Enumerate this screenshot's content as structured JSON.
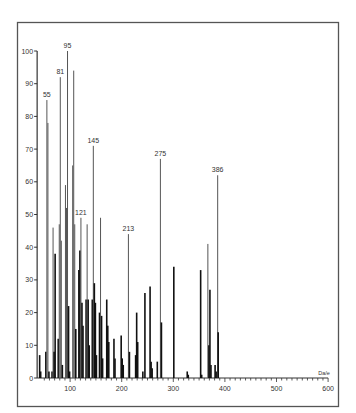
{
  "chart_data": {
    "type": "bar",
    "subtype": "mass-spectrum",
    "title": "",
    "xlabel": "Da/e",
    "ylabel": "",
    "xlim": [
      40,
      600
    ],
    "ylim": [
      0,
      100
    ],
    "grid": false,
    "legend": null,
    "x_ticks": [
      100,
      200,
      300,
      400,
      500,
      600
    ],
    "y_ticks": [
      0,
      10,
      20,
      30,
      40,
      50,
      60,
      70,
      80,
      90,
      100
    ],
    "peak_labels": [
      {
        "mz": 55,
        "value": 85,
        "label": "55"
      },
      {
        "mz": 81,
        "value": 92,
        "label": "81"
      },
      {
        "mz": 95,
        "value": 100,
        "label": "95"
      },
      {
        "mz": 121,
        "value": 49,
        "label": "121"
      },
      {
        "mz": 145,
        "value": 71,
        "label": "145"
      },
      {
        "mz": 213,
        "value": 44,
        "label": "213"
      },
      {
        "mz": 275,
        "value": 67,
        "label": "275"
      },
      {
        "mz": 386,
        "value": 62,
        "label": "386"
      }
    ],
    "peaks": [
      {
        "mz": 41,
        "value": 7
      },
      {
        "mz": 43,
        "value": 2
      },
      {
        "mz": 53,
        "value": 8
      },
      {
        "mz": 55,
        "value": 85
      },
      {
        "mz": 57,
        "value": 78
      },
      {
        "mz": 59,
        "value": 2
      },
      {
        "mz": 65,
        "value": 2
      },
      {
        "mz": 67,
        "value": 46
      },
      {
        "mz": 69,
        "value": 8
      },
      {
        "mz": 71,
        "value": 38
      },
      {
        "mz": 77,
        "value": 12
      },
      {
        "mz": 79,
        "value": 47
      },
      {
        "mz": 81,
        "value": 92
      },
      {
        "mz": 83,
        "value": 42
      },
      {
        "mz": 85,
        "value": 4
      },
      {
        "mz": 91,
        "value": 59
      },
      {
        "mz": 93,
        "value": 52
      },
      {
        "mz": 95,
        "value": 100
      },
      {
        "mz": 97,
        "value": 22
      },
      {
        "mz": 99,
        "value": 2
      },
      {
        "mz": 105,
        "value": 65
      },
      {
        "mz": 107,
        "value": 94
      },
      {
        "mz": 109,
        "value": 47
      },
      {
        "mz": 111,
        "value": 15
      },
      {
        "mz": 117,
        "value": 33
      },
      {
        "mz": 119,
        "value": 39
      },
      {
        "mz": 121,
        "value": 49
      },
      {
        "mz": 123,
        "value": 23
      },
      {
        "mz": 125,
        "value": 16
      },
      {
        "mz": 131,
        "value": 24
      },
      {
        "mz": 133,
        "value": 47
      },
      {
        "mz": 135,
        "value": 24
      },
      {
        "mz": 137,
        "value": 10
      },
      {
        "mz": 143,
        "value": 24
      },
      {
        "mz": 145,
        "value": 71
      },
      {
        "mz": 147,
        "value": 29
      },
      {
        "mz": 149,
        "value": 23
      },
      {
        "mz": 151,
        "value": 7
      },
      {
        "mz": 157,
        "value": 20
      },
      {
        "mz": 159,
        "value": 49
      },
      {
        "mz": 161,
        "value": 19
      },
      {
        "mz": 163,
        "value": 6
      },
      {
        "mz": 171,
        "value": 24
      },
      {
        "mz": 173,
        "value": 16
      },
      {
        "mz": 175,
        "value": 11
      },
      {
        "mz": 185,
        "value": 12
      },
      {
        "mz": 187,
        "value": 6
      },
      {
        "mz": 199,
        "value": 13
      },
      {
        "mz": 201,
        "value": 6
      },
      {
        "mz": 203,
        "value": 4
      },
      {
        "mz": 213,
        "value": 44
      },
      {
        "mz": 215,
        "value": 8
      },
      {
        "mz": 227,
        "value": 7
      },
      {
        "mz": 229,
        "value": 20
      },
      {
        "mz": 231,
        "value": 11
      },
      {
        "mz": 241,
        "value": 2
      },
      {
        "mz": 245,
        "value": 26
      },
      {
        "mz": 255,
        "value": 28
      },
      {
        "mz": 257,
        "value": 5
      },
      {
        "mz": 259,
        "value": 3
      },
      {
        "mz": 269,
        "value": 5
      },
      {
        "mz": 275,
        "value": 67
      },
      {
        "mz": 277,
        "value": 17
      },
      {
        "mz": 301,
        "value": 34
      },
      {
        "mz": 327,
        "value": 2
      },
      {
        "mz": 329,
        "value": 1
      },
      {
        "mz": 353,
        "value": 33
      },
      {
        "mz": 355,
        "value": 1
      },
      {
        "mz": 367,
        "value": 41
      },
      {
        "mz": 369,
        "value": 10
      },
      {
        "mz": 371,
        "value": 27
      },
      {
        "mz": 373,
        "value": 4
      },
      {
        "mz": 381,
        "value": 4
      },
      {
        "mz": 383,
        "value": 2
      },
      {
        "mz": 386,
        "value": 62
      },
      {
        "mz": 387,
        "value": 14
      }
    ]
  }
}
